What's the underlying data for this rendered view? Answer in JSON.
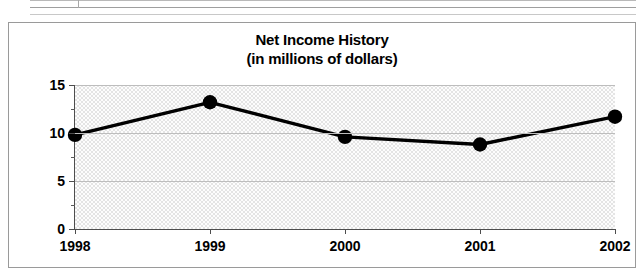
{
  "document_fragment": {
    "label": "partial-table-row-above-chart"
  },
  "chart_data": {
    "type": "line",
    "title": "Net Income History",
    "subtitle": "(in millions of dollars)",
    "xlabel": "",
    "ylabel": "",
    "categories": [
      "1998",
      "1999",
      "2000",
      "2001",
      "2002"
    ],
    "values": [
      9.8,
      13.2,
      9.6,
      8.8,
      11.7
    ],
    "series": [
      {
        "name": "Net Income",
        "values": [
          9.8,
          13.2,
          9.6,
          8.8,
          11.7
        ]
      }
    ],
    "ylim": [
      0,
      15
    ],
    "xlim": [
      "1998",
      "2002"
    ],
    "y_ticks": [
      "0",
      "5",
      "10",
      "15"
    ],
    "y_tick_values": [
      0,
      5,
      10,
      15
    ],
    "y_minor_tick_values": [
      2.5,
      7.5,
      12.5
    ],
    "x_ticks": [
      "1998",
      "1999",
      "2000",
      "2001",
      "2002"
    ],
    "grid": true,
    "grid_axis": "y",
    "legend": false,
    "legend_position": "none",
    "marker": "circle-filled",
    "colors": {
      "line": "#000000",
      "marker": "#000000",
      "plot_background": "#ededed",
      "axis": "#4d4d4d",
      "gridline": "#bdbdbd",
      "frame_border": "#9a9a9a",
      "text": "#000000"
    }
  }
}
